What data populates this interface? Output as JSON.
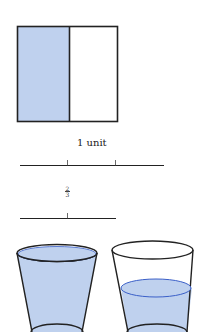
{
  "square_model": {
    "parts": 2,
    "shaded_parts": 1,
    "fill_color": "#bfd1ee",
    "stroke_color": "#222222"
  },
  "number_line_unit": {
    "label": "1 unit",
    "ticks": 2
  },
  "number_line_fraction": {
    "numerator": "2",
    "denominator": "3"
  },
  "cups": [
    {
      "name": "full-cup",
      "fill_level": "full",
      "water_color": "#bfd1ee",
      "surface_color": "#3a5fc8"
    },
    {
      "name": "partial-cup",
      "fill_level": "partial",
      "water_color": "#bfd1ee",
      "surface_color": "#3a5fc8"
    }
  ]
}
